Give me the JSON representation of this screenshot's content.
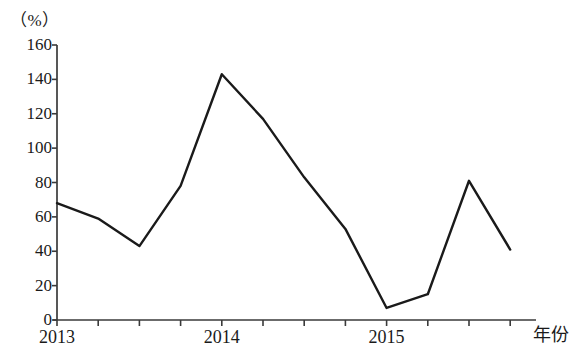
{
  "chart_data": {
    "type": "line",
    "title": "",
    "subtitle": "",
    "unit_label": "（%）",
    "ylabel": "",
    "xlabel": "年份",
    "ylim": [
      0,
      160
    ],
    "yticks": [
      0,
      20,
      40,
      60,
      80,
      100,
      120,
      140,
      160
    ],
    "ytick_labels": [
      "0",
      "20",
      "40",
      "60",
      "80",
      "100",
      "120",
      "140",
      "160"
    ],
    "xtick_labels": [
      "2013",
      "2014",
      "2015"
    ],
    "xtick_positions": [
      2013,
      2014,
      2015
    ],
    "grid": false,
    "legend": null,
    "line_color": "#1a1a1a",
    "axis_color": "#3a3a3a",
    "x": [
      2013.0,
      2013.25,
      2013.5,
      2013.75,
      2014.0,
      2014.25,
      2014.5,
      2014.75,
      2015.0,
      2015.25,
      2015.5,
      2015.75
    ],
    "values": [
      68,
      59,
      43,
      78,
      143,
      117,
      83,
      53,
      7,
      15,
      81,
      41
    ],
    "series": [
      {
        "name": "",
        "values": [
          68,
          59,
          43,
          78,
          143,
          117,
          83,
          53,
          7,
          15,
          81,
          41
        ]
      }
    ]
  }
}
